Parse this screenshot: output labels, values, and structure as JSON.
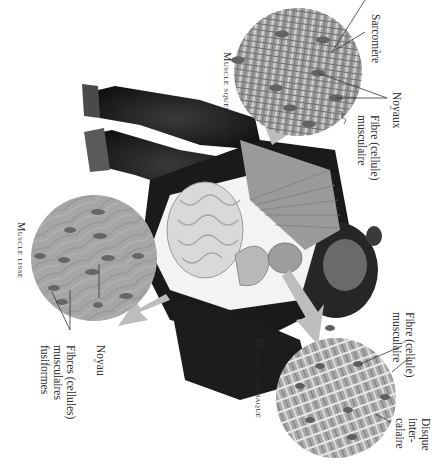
{
  "figure": {
    "orientation": "rotated 90 degrees clockwise",
    "colors": {
      "background": "#ffffff",
      "fur": "#1c1c1c",
      "tissue_gray": "#9a9a9a",
      "tissue_light": "#c9c9c9",
      "nucleus": "#5e5e5e",
      "arrow": "#b5b5b5",
      "leader_line": "#333333"
    }
  },
  "panels": {
    "skeletal": {
      "title": "Muscle squelettique",
      "labels": {
        "sarcomere": "Sarcomère",
        "nuclei": "Noyaux",
        "fiber": "Fibre (cellule)\nmusculaire"
      }
    },
    "cardiac": {
      "title": "Muscle cardiaque",
      "labels": {
        "fiber": "Fibre (cellule)\nmusculaire",
        "nucleus": "Noyau",
        "disc": "Disque\ninter-\ncalaire"
      }
    },
    "smooth": {
      "title": "Muscle lisse",
      "labels": {
        "nucleus": "Noyau",
        "fibers": "Fibres (cellules)\nmusculaires\nfusiformes"
      }
    }
  }
}
